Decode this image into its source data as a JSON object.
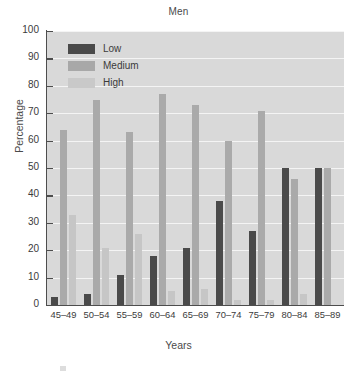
{
  "chart_data": {
    "type": "bar",
    "title": "Men",
    "xlabel": "Years",
    "ylabel": "Percentage",
    "categories": [
      "45–49",
      "50–54",
      "55–59",
      "60–64",
      "65–69",
      "70–74",
      "75–79",
      "80–84",
      "85–89"
    ],
    "series": [
      {
        "name": "Low",
        "color": "#4a4a4a",
        "values": [
          3,
          4,
          11,
          18,
          21,
          38,
          27,
          50,
          50
        ]
      },
      {
        "name": "Medium",
        "color": "#aaaaaa",
        "values": [
          64,
          75,
          63,
          77,
          73,
          60,
          71,
          46,
          50
        ]
      },
      {
        "name": "High",
        "color": "#c6c6c6",
        "values": [
          33,
          21,
          26,
          5,
          6,
          2,
          2,
          4,
          0
        ]
      }
    ],
    "ylim": [
      0,
      100
    ],
    "yticks": [
      0,
      10,
      20,
      30,
      40,
      50,
      60,
      70,
      80,
      90,
      100
    ],
    "ytick_labels": [
      "0",
      "10",
      "20",
      "30",
      "40",
      "50",
      "60",
      "70",
      "80",
      "90",
      "100"
    ],
    "grid": true,
    "legend_position": "top-left",
    "plot_background": "#d9d9d9",
    "gridline_color": "#f4f4f4"
  }
}
